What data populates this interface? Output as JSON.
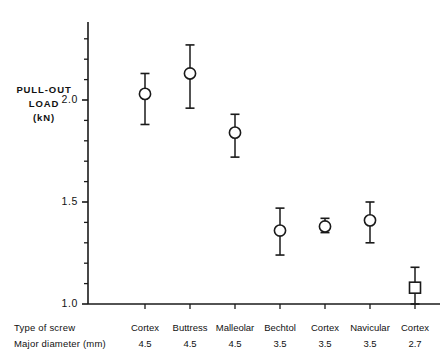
{
  "figure": {
    "y_axis_title_lines": [
      "PULL-OUT",
      "LOAD",
      "(kN)"
    ],
    "y_tick_labels": [
      "2.0",
      "1.5",
      "1.0"
    ],
    "row_header_type": "Type of screw",
    "row_header_diameter": "Major diameter (mm)",
    "ink_color": "#1a1a1a",
    "background_color": "#ffffff"
  },
  "chart_data": {
    "type": "scatter",
    "title": "",
    "xlabel": "Type of screw / Major diameter (mm)",
    "ylabel": "PULL-OUT LOAD (kN)",
    "ylim": [
      1.0,
      2.35
    ],
    "y_ticks_major": [
      1.0,
      1.5,
      2.0
    ],
    "y_ticks_minor": [
      1.1,
      1.2,
      1.3,
      1.4,
      1.6,
      1.7,
      1.8,
      1.9,
      2.1,
      2.2,
      2.3
    ],
    "grid": false,
    "legend": "none",
    "error_bar_type": "range",
    "categories": [
      "Cortex",
      "Buttress",
      "Malleolar",
      "Bechtol",
      "Cortex",
      "Navicular",
      "Cortex"
    ],
    "diameters_mm": [
      "4.5",
      "4.5",
      "4.5",
      "3.5",
      "3.5",
      "3.5",
      "2.7"
    ],
    "values": [
      2.03,
      2.13,
      1.84,
      1.36,
      1.38,
      1.41,
      1.08
    ],
    "err_low": [
      1.88,
      1.96,
      1.72,
      1.24,
      1.35,
      1.3,
      1.0
    ],
    "err_high": [
      2.13,
      2.27,
      1.93,
      1.47,
      1.42,
      1.5,
      1.18
    ],
    "markers": [
      "circle",
      "circle",
      "circle",
      "circle",
      "circle",
      "circle",
      "square"
    ],
    "points": [
      {
        "label": "Cortex",
        "diameter": "4.5",
        "value": 2.03,
        "low": 1.88,
        "high": 2.13,
        "marker": "circle"
      },
      {
        "label": "Buttress",
        "diameter": "4.5",
        "value": 2.13,
        "low": 1.96,
        "high": 2.27,
        "marker": "circle"
      },
      {
        "label": "Malleolar",
        "diameter": "4.5",
        "value": 1.84,
        "low": 1.72,
        "high": 1.93,
        "marker": "circle"
      },
      {
        "label": "Bechtol",
        "diameter": "3.5",
        "value": 1.36,
        "low": 1.24,
        "high": 1.47,
        "marker": "circle"
      },
      {
        "label": "Cortex",
        "diameter": "3.5",
        "value": 1.38,
        "low": 1.35,
        "high": 1.42,
        "marker": "circle"
      },
      {
        "label": "Navicular",
        "diameter": "3.5",
        "value": 1.41,
        "low": 1.3,
        "high": 1.5,
        "marker": "circle"
      },
      {
        "label": "Cortex",
        "diameter": "2.7",
        "value": 1.08,
        "low": 1.0,
        "high": 1.18,
        "marker": "square"
      }
    ]
  }
}
